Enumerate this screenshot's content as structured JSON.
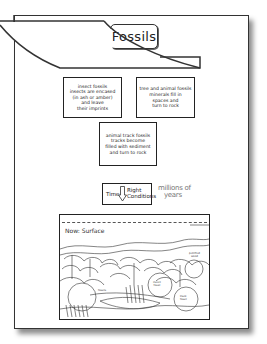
{
  "title": "Fossils",
  "boxes": {
    "insect": [
      "insect fossils",
      "insects are encased",
      "(in ash or amber)",
      "and leave",
      "their imprints"
    ],
    "tree": [
      "tree and animal fossils",
      "minerals fill in",
      "spaces and",
      "turn to rock"
    ],
    "track": [
      "animal track fossils",
      "tracks become",
      "filled with sediment",
      "and turn to rock"
    ]
  },
  "time_box": {
    "time_label": "Time",
    "arrow_icon": "down-arrow-icon",
    "right_label": "Right",
    "conditions_label": "Conditions"
  },
  "millions": {
    "line1": "millions of",
    "line2": "years"
  },
  "scene": {
    "surface_label": "Now: Surface",
    "labels": {
      "petrified": [
        "petrified",
        "wood"
      ],
      "fossils_left": [
        "fossils"
      ],
      "circle_mid": [
        "insect",
        "fossil"
      ],
      "circle_right": [
        "track",
        "fossil"
      ]
    }
  }
}
